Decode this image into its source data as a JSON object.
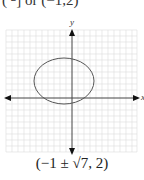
{
  "header_fragment": {
    "left": "(  ",
    "numerator": "π",
    "denominator": "2",
    "right": "]  or (−1,2)"
  },
  "graph": {
    "x_axis_label": "x",
    "y_axis_label": "y",
    "shape": "ellipse",
    "center": [
      -1,
      2
    ],
    "grid": true,
    "line_color": "#555555",
    "grid_color": "#d9d9d9"
  },
  "caption": "(−1 ± √7, 2)"
}
